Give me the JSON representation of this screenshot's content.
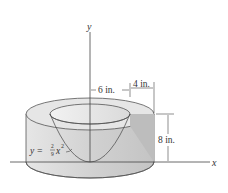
{
  "figure": {
    "axes": {
      "x_label": "x",
      "y_label": "y"
    },
    "dimensions": {
      "inner_radius": "6 in.",
      "wall_thickness": "4 in.",
      "height": "8 in."
    },
    "curve": {
      "equation_lhs": "y = ",
      "coef_num": "2",
      "coef_den": "9",
      "var": "x",
      "exp": "2"
    },
    "colors": {
      "line": "#444444",
      "outer_side": "#d2d2d2",
      "top_ring": "#e4e4e4",
      "bowl_inside": "#ececec",
      "cut_face": "#bdbdbd"
    }
  }
}
